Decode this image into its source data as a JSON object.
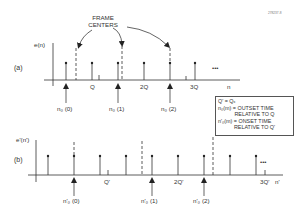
{
  "figure_id": "278237-8",
  "annotation": {
    "label": "FRAME\nCENTERS",
    "line1": "FRAME",
    "line2": "CENTERS"
  },
  "panel_a": {
    "label": "(a)",
    "ylabel": "e(n)",
    "xlabel": "n",
    "ticks": [
      "Q",
      "2Q",
      "3Q"
    ],
    "markers": [
      "n₀ (0)",
      "n₀ (1)",
      "n₀ (2)"
    ],
    "ellipsis": "•••"
  },
  "panel_b": {
    "label": "(b)",
    "ylabel": "e'(n')",
    "xlabel": "n'",
    "ticks": [
      "Q'",
      "2Q'",
      "3Q'"
    ],
    "markers": [
      "n'₀ (0)",
      "n'₀ (1)",
      "n'₀ (2)"
    ],
    "ellipsis": "•••"
  },
  "legend": {
    "line1": "Q' = Qₓ",
    "line2": "n₀(m) = OUTSET TIME",
    "line3": "RELATIVE TO Q",
    "line4": "n'₀(m) = ONSET TIME",
    "line5": "RELATIVE TO Q'"
  }
}
